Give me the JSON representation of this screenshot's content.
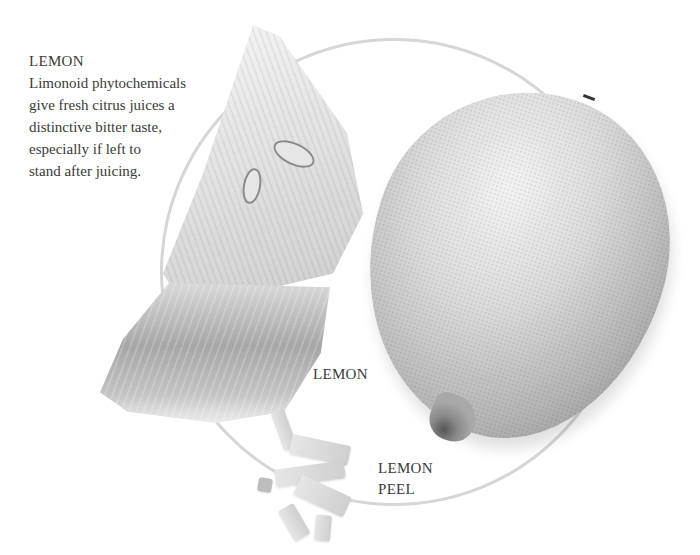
{
  "intro": {
    "title": "LEMON",
    "lines": [
      "Limonoid phytochemicals",
      "give fresh citrus juices a",
      "distinctive bitter taste,",
      "especially if left to",
      "stand after juicing."
    ]
  },
  "labels": {
    "lemon": "LEMON",
    "peel_line1": "LEMON",
    "peel_line2": "PEEL"
  },
  "images": {
    "whole_lemon": "whole lemon photo (grayscale)",
    "lemon_wedges": "two lemon wedges photo (grayscale)",
    "lemon_peel": "shredded lemon peel photo (grayscale)"
  },
  "colors": {
    "text": "#3a3a3a",
    "circle": "#d6d6d6",
    "background": "#ffffff"
  }
}
